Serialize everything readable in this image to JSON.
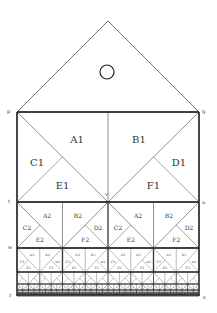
{
  "diagram": {
    "colors": {
      "line": "#333333",
      "background": "#ffffff",
      "text": "#333333"
    },
    "roof": {
      "apex": [
        108,
        21
      ],
      "left": [
        17,
        112
      ],
      "right": [
        199,
        112
      ]
    },
    "circle": {
      "cx": 107,
      "cy": 72,
      "r": 7
    },
    "rect": {
      "x0": 17,
      "x1": 199,
      "y_top": 112,
      "y_bottom": 296
    },
    "points": [
      {
        "name": "p",
        "x": 7,
        "y": 114
      },
      {
        "name": "q",
        "x": 202,
        "y": 114
      },
      {
        "name": "t",
        "x": 8,
        "y": 204
      },
      {
        "name": "u",
        "x": 202,
        "y": 205
      },
      {
        "name": "v",
        "x": 105,
        "y": 197
      },
      {
        "name": "w",
        "x": 8,
        "y": 250
      },
      {
        "name": "r",
        "x": 9,
        "y": 298
      },
      {
        "name": "s",
        "x": 203,
        "y": 300
      }
    ],
    "levels": [
      {
        "level": 1,
        "y0": 112,
        "y1": 202,
        "units": 1,
        "labels": [
          "A1",
          "B1",
          "C1",
          "D1",
          "E1",
          "F1"
        ],
        "font": 10
      },
      {
        "level": 2,
        "y0": 202,
        "y1": 248,
        "units": 2,
        "labels": [
          "A2",
          "B2",
          "C2",
          "D2",
          "E2",
          "F2"
        ],
        "font": 6
      },
      {
        "level": 3,
        "y0": 248,
        "y1": 272,
        "units": 4,
        "labels": [
          "A3",
          "B3",
          "C3",
          "D3",
          "E3",
          "F3"
        ],
        "font": 3.2
      },
      {
        "level": 4,
        "y0": 272,
        "y1": 284,
        "units": 8,
        "labels": [],
        "font": 0
      },
      {
        "level": 5,
        "y0": 284,
        "y1": 290,
        "units": 16,
        "labels": [],
        "font": 0
      },
      {
        "level": 6,
        "y0": 290,
        "y1": 293,
        "units": 32,
        "labels": [],
        "font": 0
      },
      {
        "level": 7,
        "y0": 293,
        "y1": 294.5,
        "units": 64,
        "labels": [],
        "font": 0
      },
      {
        "level": 8,
        "y0": 294.5,
        "y1": 296,
        "units": 128,
        "labels": [],
        "font": 0
      }
    ]
  }
}
